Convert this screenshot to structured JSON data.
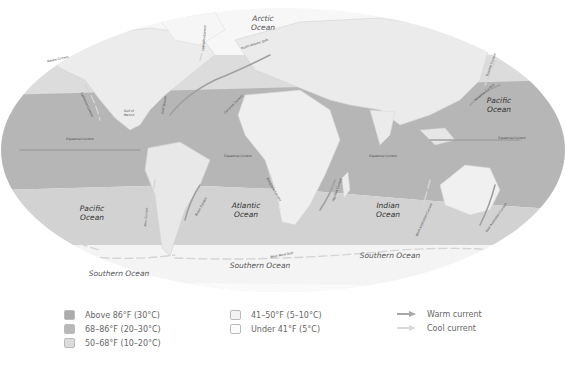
{
  "map": {
    "oceans": [
      {
        "name": "Arctic Ocean",
        "line1": "Arctic",
        "line2": "Ocean",
        "x": 263,
        "y": 21
      },
      {
        "name": "Pacific Ocean (east)",
        "line1": "Pacific",
        "line2": "Ocean",
        "x": 499,
        "y": 103
      },
      {
        "name": "Pacific Ocean (south)",
        "line1": "Pacific",
        "line2": "Ocean",
        "x": 92,
        "y": 211
      },
      {
        "name": "Atlantic Ocean",
        "line1": "Atlantic",
        "line2": "Ocean",
        "x": 246,
        "y": 208
      },
      {
        "name": "Indian Ocean",
        "line1": "Indian",
        "line2": "Ocean",
        "x": 388,
        "y": 208
      },
      {
        "name": "Southern Ocean (west)",
        "line1": "Southern Ocean",
        "line2": "",
        "x": 119,
        "y": 276
      },
      {
        "name": "Southern Ocean (center)",
        "line1": "Southern Ocean",
        "line2": "",
        "x": 260,
        "y": 268
      },
      {
        "name": "Southern Ocean (east)",
        "line1": "Southern Ocean",
        "line2": "",
        "x": 390,
        "y": 258
      }
    ],
    "seas": [
      {
        "name": "Gulf of Mexico",
        "line1": "Gulf of",
        "line2": "Mexico",
        "x": 129,
        "y": 112
      }
    ],
    "currents": [
      {
        "name": "Alaska Current",
        "x": 58,
        "y": 60,
        "rotate": -12
      },
      {
        "name": "California Current",
        "x": 86,
        "y": 105,
        "rotate": 65
      },
      {
        "name": "Labrador Current",
        "x": 205,
        "y": 38,
        "rotate": -85
      },
      {
        "name": "North Atlantic Drift",
        "x": 255,
        "y": 45,
        "rotate": -18
      },
      {
        "name": "Gulf Stream",
        "x": 165,
        "y": 105,
        "rotate": -80
      },
      {
        "name": "Canaries Current",
        "x": 234,
        "y": 105,
        "rotate": -45
      },
      {
        "name": "Equatorial Current",
        "x": 80,
        "y": 140,
        "rotate": 0
      },
      {
        "name": "Equatorial Current",
        "x": 238,
        "y": 157,
        "rotate": 0
      },
      {
        "name": "Equatorial Current",
        "x": 383,
        "y": 157,
        "rotate": 0
      },
      {
        "name": "Equatorial Current",
        "x": 512,
        "y": 139,
        "rotate": 0
      },
      {
        "name": "Kuroshio Current",
        "x": 485,
        "y": 93,
        "rotate": -40
      },
      {
        "name": "Oyashio Current",
        "x": 492,
        "y": 65,
        "rotate": -70
      },
      {
        "name": "Benguela Current",
        "x": 273,
        "y": 190,
        "rotate": 60
      },
      {
        "name": "Brazil Current",
        "x": 202,
        "y": 207,
        "rotate": -60
      },
      {
        "name": "Peru Current",
        "x": 147,
        "y": 217,
        "rotate": -85
      },
      {
        "name": "Agulhas Current",
        "x": 338,
        "y": 190,
        "rotate": -70
      },
      {
        "name": "West Australian Current",
        "x": 425,
        "y": 220,
        "rotate": -65
      },
      {
        "name": "East Australian Current",
        "x": 497,
        "y": 218,
        "rotate": -55
      },
      {
        "name": "West Wind Drift",
        "x": 282,
        "y": 256,
        "rotate": -10
      }
    ]
  },
  "legend": {
    "temperature": [
      {
        "label": "Above 86°F (30°C)",
        "color": "#ababab"
      },
      {
        "label": "68–86°F (20–30°C)",
        "color": "#b8b8b8"
      },
      {
        "label": "50–68°F (10–20°C)",
        "color": "#dcdcdc"
      },
      {
        "label": "41–50°F (5–10°C)",
        "color": "#f3f3f3"
      },
      {
        "label": "Under 41°F (5°C)",
        "color": "#fbfbfb"
      }
    ],
    "currents": [
      {
        "label": "Warm current",
        "color": "#a8a8a8"
      },
      {
        "label": "Cool current",
        "color": "#d8d8d8"
      }
    ]
  },
  "colors": {
    "warm_band": "#b4b4b4",
    "mid_band": "#c4c4c4",
    "cool_band": "#dadada",
    "cold_band": "#efefef",
    "land": "#e8e8e8",
    "polar": "#f7f7f7"
  }
}
